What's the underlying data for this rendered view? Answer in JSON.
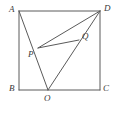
{
  "figure": {
    "type": "plane-geometry-diagram",
    "canvas": {
      "width": 118,
      "height": 117,
      "background": "#ffffff"
    },
    "style": {
      "stroke_color": "#5a5a5a",
      "stroke_width": 1,
      "label_color": "#3a3a3a",
      "label_font_size": 9
    },
    "points": [
      {
        "id": "A",
        "label": "A",
        "x": 19,
        "y": 11,
        "label_x": 9,
        "label_y": 5,
        "role": "square-vertex-top-left"
      },
      {
        "id": "D",
        "label": "D",
        "x": 100,
        "y": 11,
        "label_x": 104,
        "label_y": 4,
        "role": "square-vertex-top-right"
      },
      {
        "id": "B",
        "label": "B",
        "x": 19,
        "y": 90,
        "label_x": 9,
        "label_y": 84,
        "role": "square-vertex-bottom-left"
      },
      {
        "id": "C",
        "label": "C",
        "x": 100,
        "y": 90,
        "label_x": 103,
        "label_y": 84,
        "role": "square-vertex-bottom-right"
      },
      {
        "id": "O",
        "label": "O",
        "x": 48,
        "y": 90,
        "label_x": 44,
        "label_y": 94,
        "role": "point-on-side-BC"
      },
      {
        "id": "P",
        "label": "P",
        "x": 38,
        "y": 48,
        "label_x": 28,
        "label_y": 50,
        "role": "point-on-segment-AO"
      },
      {
        "id": "Q",
        "label": "Q",
        "x": 79,
        "y": 40,
        "label_x": 82,
        "label_y": 32,
        "role": "point-on-segment-OD"
      }
    ],
    "segments": [
      {
        "id": "AD",
        "name": "square-side-top",
        "from": "A",
        "to": "D"
      },
      {
        "id": "DC",
        "name": "square-side-right",
        "from": "D",
        "to": "C"
      },
      {
        "id": "CB",
        "name": "square-side-bottom",
        "from": "C",
        "to": "B"
      },
      {
        "id": "BA",
        "name": "square-side-left",
        "from": "B",
        "to": "A"
      },
      {
        "id": "AO",
        "name": "cevian-A-to-O",
        "from": "A",
        "to": "O"
      },
      {
        "id": "PD",
        "name": "segment-P-to-D",
        "from": "P",
        "to": "D"
      },
      {
        "id": "PQ",
        "name": "segment-P-to-Q",
        "from": "P",
        "to": "Q"
      },
      {
        "id": "OD",
        "name": "segment-O-to-D",
        "from": "O",
        "to": "D"
      }
    ]
  }
}
